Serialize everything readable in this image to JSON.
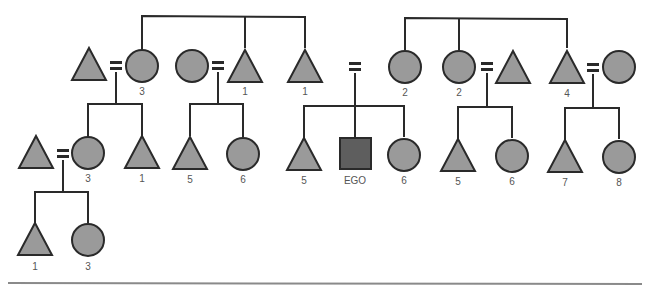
{
  "diagram": {
    "type": "kinship-chart",
    "colors": {
      "line": "#2a2a2a",
      "member_fill": "#9a9a9a",
      "ego_fill": "#5e5e5e",
      "label": "#555555",
      "rule": "#8a8a8a"
    },
    "legend_symbols": {
      "triangle": "male",
      "circle": "female",
      "square": "ego",
      "equals": "marriage"
    },
    "ego_label": "EGO",
    "generations": {
      "parents": [
        {
          "id": "p1",
          "shape": "triangle",
          "label": ""
        },
        {
          "id": "p2",
          "shape": "circle",
          "label": "3"
        },
        {
          "id": "p3",
          "shape": "circle",
          "label": ""
        },
        {
          "id": "p4",
          "shape": "triangle",
          "label": "1"
        },
        {
          "id": "p5",
          "shape": "triangle",
          "label": "1"
        },
        {
          "id": "p6",
          "shape": "circle",
          "label": "2"
        },
        {
          "id": "p7",
          "shape": "circle",
          "label": "2"
        },
        {
          "id": "p8",
          "shape": "triangle",
          "label": ""
        },
        {
          "id": "p9",
          "shape": "triangle",
          "label": "4"
        },
        {
          "id": "p10",
          "shape": "circle",
          "label": ""
        }
      ],
      "ego_generation": [
        {
          "id": "g1",
          "shape": "triangle",
          "label": ""
        },
        {
          "id": "g2",
          "shape": "circle",
          "label": "3"
        },
        {
          "id": "g3",
          "shape": "triangle",
          "label": "1"
        },
        {
          "id": "g4",
          "shape": "triangle",
          "label": "5"
        },
        {
          "id": "g5",
          "shape": "circle",
          "label": "6"
        },
        {
          "id": "g6",
          "shape": "triangle",
          "label": "5"
        },
        {
          "id": "g7",
          "shape": "square",
          "label": "EGO"
        },
        {
          "id": "g8",
          "shape": "circle",
          "label": "6"
        },
        {
          "id": "g9",
          "shape": "triangle",
          "label": "5"
        },
        {
          "id": "g10",
          "shape": "circle",
          "label": "6"
        },
        {
          "id": "g11",
          "shape": "triangle",
          "label": "7"
        },
        {
          "id": "g12",
          "shape": "circle",
          "label": "8"
        }
      ],
      "children": [
        {
          "id": "c1",
          "shape": "triangle",
          "label": "1"
        },
        {
          "id": "c2",
          "shape": "circle",
          "label": "3"
        }
      ]
    }
  }
}
